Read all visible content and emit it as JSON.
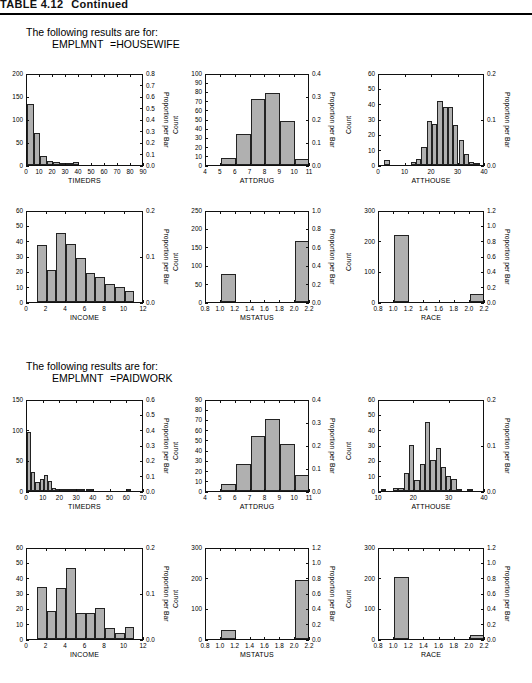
{
  "table_header": {
    "number": "TABLE 4.12",
    "text": "Continued"
  },
  "sections": [
    {
      "id": "housewife",
      "caption_line1": "The following results are for:",
      "caption_var": "EMPLMNT",
      "caption_value": "=HOUSEWIFE"
    },
    {
      "id": "paidwork",
      "caption_line1": "The following results are for:",
      "caption_var": "EMPLMNT",
      "caption_value": "=PAIDWORK"
    }
  ],
  "axis_titles": {
    "count": "Count",
    "proportion": "Proportion per Bar"
  },
  "chart_data": [
    {
      "id": "hw-timedrs",
      "type": "bar",
      "group": "HOUSEWIFE",
      "title": "",
      "xlabel": "TIMEDRS",
      "ylabel": "Count",
      "y2label": "Proportion per Bar",
      "xlim": [
        0,
        90
      ],
      "ylim": [
        0,
        200
      ],
      "y2lim": [
        0.0,
        0.8
      ],
      "grid": false,
      "xticks": [
        0,
        10,
        20,
        30,
        40,
        50,
        60,
        70,
        80,
        90
      ],
      "yticks": [
        0,
        50,
        100,
        150,
        200
      ],
      "y2ticks": [
        "0.0",
        "0.1",
        "0.2",
        "0.3",
        "0.4",
        "0.5",
        "0.6",
        "0.7",
        "0.8"
      ],
      "bin_width": 5,
      "bins": [
        0,
        5,
        10,
        15,
        20,
        25,
        30,
        35,
        40
      ],
      "values": [
        132,
        69,
        20,
        9,
        7,
        5,
        5,
        6
      ]
    },
    {
      "id": "hw-attdrug",
      "type": "bar",
      "group": "HOUSEWIFE",
      "title": "",
      "xlabel": "ATTDRUG",
      "ylabel": "Count",
      "y2label": "Proportion per Bar",
      "xlim": [
        4,
        11
      ],
      "ylim": [
        0,
        100
      ],
      "y2lim": [
        0.0,
        0.4
      ],
      "grid": false,
      "xticks": [
        4,
        5,
        6,
        7,
        8,
        9,
        10,
        11
      ],
      "yticks": [
        0,
        10,
        20,
        30,
        40,
        50,
        60,
        70,
        80,
        90,
        100
      ],
      "y2ticks": [
        "0.0",
        "0.1",
        "0.2",
        "0.3",
        "0.4"
      ],
      "bin_width": 1,
      "bins": [
        5,
        6,
        7,
        8,
        9,
        10
      ],
      "values": [
        8,
        34,
        72,
        78,
        48,
        6
      ]
    },
    {
      "id": "hw-atthouse",
      "type": "bar",
      "group": "HOUSEWIFE",
      "title": "",
      "xlabel": "ATTHOUSE",
      "ylabel": "Count",
      "y2label": "Proportion per Bar",
      "xlim": [
        0,
        40
      ],
      "ylim": [
        0,
        60
      ],
      "y2lim": [
        0.0,
        0.2
      ],
      "grid": false,
      "xticks": [
        0,
        10,
        20,
        30,
        40
      ],
      "yticks": [
        0,
        10,
        20,
        30,
        40,
        50,
        60
      ],
      "y2ticks": [
        "0.0",
        "0.1",
        "0.2"
      ],
      "bin_width": 2,
      "bins": [
        2,
        12,
        14,
        16,
        18,
        20,
        22,
        24,
        26,
        28,
        30,
        32,
        34,
        36
      ],
      "values": [
        3,
        2,
        4,
        12,
        29,
        27,
        42,
        38,
        38,
        26,
        16,
        7,
        2,
        1
      ]
    },
    {
      "id": "hw-income",
      "type": "bar",
      "group": "HOUSEWIFE",
      "title": "",
      "xlabel": "INCOME",
      "ylabel": "Count",
      "y2label": "Proportion per Bar",
      "xlim": [
        0,
        12
      ],
      "ylim": [
        0,
        60
      ],
      "y2lim": [
        0.0,
        0.2
      ],
      "grid": false,
      "xticks": [
        0,
        2,
        4,
        6,
        8,
        10,
        12
      ],
      "yticks": [
        0,
        10,
        20,
        30,
        40,
        50,
        60
      ],
      "y2ticks": [
        "0.0",
        "0.1",
        "0.2"
      ],
      "bin_width": 1,
      "bins": [
        1,
        2,
        3,
        4,
        5,
        6,
        7,
        8,
        9,
        10
      ],
      "values": [
        37,
        21,
        45,
        38,
        29,
        19,
        16,
        12,
        10,
        7
      ]
    },
    {
      "id": "hw-mstatus",
      "type": "bar",
      "group": "HOUSEWIFE",
      "title": "",
      "xlabel": "MSTATUS",
      "ylabel": "Count",
      "y2label": "Proportion per Bar",
      "xlim": [
        0.8,
        2.2
      ],
      "ylim": [
        0,
        250
      ],
      "y2lim": [
        0.0,
        1.0
      ],
      "grid": false,
      "xticks": [
        "0.8",
        "1.0",
        "1.2",
        "1.4",
        "1.6",
        "1.8",
        "2.0",
        "2.2"
      ],
      "yticks": [
        0,
        50,
        100,
        150,
        200,
        250
      ],
      "y2ticks": [
        "0.0",
        "0.2",
        "0.4",
        "0.6",
        "0.8",
        "1.0"
      ],
      "bin_width": 0.2,
      "bins": [
        1.0,
        2.0
      ],
      "values": [
        76,
        166
      ]
    },
    {
      "id": "hw-race",
      "type": "bar",
      "group": "HOUSEWIFE",
      "title": "",
      "xlabel": "RACE",
      "ylabel": "Count",
      "y2label": "Proportion per Bar",
      "xlim": [
        0.8,
        2.2
      ],
      "ylim": [
        0,
        300
      ],
      "y2lim": [
        0.0,
        1.2
      ],
      "grid": false,
      "xticks": [
        "0.8",
        "1.0",
        "1.2",
        "1.4",
        "1.6",
        "1.8",
        "2.0",
        "2.2"
      ],
      "yticks": [
        0,
        100,
        200,
        300
      ],
      "y2ticks": [
        "0.0",
        "0.2",
        "0.4",
        "0.6",
        "0.8",
        "1.0",
        "1.2"
      ],
      "bin_width": 0.2,
      "bins": [
        1.0,
        2.0
      ],
      "values": [
        218,
        27
      ]
    },
    {
      "id": "pw-timedrs",
      "type": "bar",
      "group": "PAIDWORK",
      "title": "",
      "xlabel": "TIMEDRS",
      "ylabel": "Count",
      "y2label": "Proportion per Bar",
      "xlim": [
        0,
        70
      ],
      "ylim": [
        0,
        150
      ],
      "y2lim": [
        0.0,
        0.6
      ],
      "grid": false,
      "xticks": [
        0,
        10,
        20,
        30,
        40,
        50,
        60,
        70
      ],
      "yticks": [
        0,
        50,
        100,
        150
      ],
      "y2ticks": [
        "0.0",
        "0.1",
        "0.2",
        "0.3",
        "0.4",
        "0.5",
        "0.6"
      ],
      "bin_width": 2.5,
      "bins": [
        0,
        2.5,
        5,
        7.5,
        10,
        12.5,
        15,
        17.5,
        20,
        22.5,
        25,
        27.5,
        30,
        32.5,
        35,
        37.5,
        40,
        60
      ],
      "values": [
        96,
        31,
        15,
        19,
        26,
        17,
        5,
        4,
        2,
        2,
        3,
        3,
        2,
        2,
        1,
        1,
        0,
        1
      ]
    },
    {
      "id": "pw-attdrug",
      "type": "bar",
      "group": "PAIDWORK",
      "title": "",
      "xlabel": "ATTDRUG",
      "ylabel": "Count",
      "y2label": "Proportion per Bar",
      "xlim": [
        4,
        11
      ],
      "ylim": [
        0,
        90
      ],
      "y2lim": [
        0.0,
        0.4
      ],
      "grid": false,
      "xticks": [
        4,
        5,
        6,
        7,
        8,
        9,
        10,
        11
      ],
      "yticks": [
        0,
        10,
        20,
        30,
        40,
        50,
        60,
        70,
        80,
        90
      ],
      "y2ticks": [
        "0.0",
        "0.1",
        "0.2",
        "0.3",
        "0.4"
      ],
      "bin_width": 1,
      "bins": [
        5,
        6,
        7,
        8,
        9,
        10
      ],
      "values": [
        7,
        26,
        54,
        70,
        46,
        16
      ]
    },
    {
      "id": "pw-atthouse",
      "type": "bar",
      "group": "PAIDWORK",
      "title": "",
      "xlabel": "ATTHOUSE",
      "ylabel": "Count",
      "y2label": "Proportion per Bar",
      "xlim": [
        10,
        40
      ],
      "ylim": [
        0,
        60
      ],
      "y2lim": [
        0.0,
        0.2
      ],
      "grid": false,
      "xticks": [
        10,
        20,
        30,
        40
      ],
      "yticks": [
        0,
        10,
        20,
        30,
        40,
        50,
        60
      ],
      "y2ticks": [
        "0.0",
        "0.1",
        "0.2"
      ],
      "bin_width": 1.5,
      "bins": [
        10.5,
        14,
        15.5,
        17,
        18.5,
        20,
        21.5,
        23,
        24.5,
        26,
        27.5,
        29,
        30.5,
        32,
        35
      ],
      "values": [
        1,
        2,
        2,
        12,
        30,
        7.5,
        17.5,
        45,
        20.5,
        28,
        15.5,
        9.5,
        8,
        1,
        1.5
      ]
    },
    {
      "id": "pw-income",
      "type": "bar",
      "group": "PAIDWORK",
      "title": "",
      "xlabel": "INCOME",
      "ylabel": "Count",
      "y2label": "Proportion per Bar",
      "xlim": [
        0,
        12
      ],
      "ylim": [
        0,
        60
      ],
      "y2lim": [
        0.0,
        0.2
      ],
      "grid": false,
      "xticks": [
        0,
        2,
        4,
        6,
        8,
        10,
        12
      ],
      "yticks": [
        0,
        10,
        20,
        30,
        40,
        50,
        60
      ],
      "y2ticks": [
        "0.0",
        "0.1",
        "0.2"
      ],
      "bin_width": 1,
      "bins": [
        1,
        2,
        3,
        4,
        5,
        6,
        7,
        8,
        9,
        10
      ],
      "values": [
        34,
        18,
        33,
        46,
        17,
        17,
        20,
        7,
        4,
        8
      ]
    },
    {
      "id": "pw-mstatus",
      "type": "bar",
      "group": "PAIDWORK",
      "title": "",
      "xlabel": "MSTATUS",
      "ylabel": "Count",
      "y2label": "Proportion per Bar",
      "xlim": [
        0.8,
        2.2
      ],
      "ylim": [
        0,
        300
      ],
      "y2lim": [
        0.0,
        1.2
      ],
      "grid": false,
      "xticks": [
        "0.8",
        "1.0",
        "1.2",
        "1.4",
        "1.6",
        "1.8",
        "2.0",
        "2.2"
      ],
      "yticks": [
        0,
        100,
        200,
        300
      ],
      "y2ticks": [
        "0.0",
        "0.2",
        "0.4",
        "0.6",
        "0.8",
        "1.0",
        "1.2"
      ],
      "bin_width": 0.2,
      "bins": [
        1.0,
        2.0
      ],
      "values": [
        28,
        193
      ]
    },
    {
      "id": "pw-race",
      "type": "bar",
      "group": "PAIDWORK",
      "title": "",
      "xlabel": "RACE",
      "ylabel": "Count",
      "y2label": "Proportion per Bar",
      "xlim": [
        0.8,
        2.2
      ],
      "ylim": [
        0,
        300
      ],
      "y2lim": [
        0.0,
        1.2
      ],
      "grid": false,
      "xticks": [
        "0.8",
        "1.0",
        "1.2",
        "1.4",
        "1.6",
        "1.8",
        "2.0",
        "2.2"
      ],
      "yticks": [
        0,
        100,
        200,
        300
      ],
      "y2ticks": [
        "0.0",
        "0.2",
        "0.4",
        "0.6",
        "0.8",
        "1.0",
        "1.2"
      ],
      "bin_width": 0.2,
      "bins": [
        1.0,
        2.0
      ],
      "values": [
        202,
        14
      ]
    }
  ],
  "layout": {
    "panels": [
      {
        "id": "hw-timedrs",
        "left": 26,
        "top": 74,
        "w": 117,
        "h": 92
      },
      {
        "id": "hw-attdrug",
        "left": 205,
        "top": 74,
        "w": 104,
        "h": 92
      },
      {
        "id": "hw-atthouse",
        "left": 378,
        "top": 74,
        "w": 106,
        "h": 92
      },
      {
        "id": "hw-income",
        "left": 26,
        "top": 211,
        "w": 117,
        "h": 92
      },
      {
        "id": "hw-mstatus",
        "left": 205,
        "top": 211,
        "w": 104,
        "h": 92
      },
      {
        "id": "hw-race",
        "left": 378,
        "top": 211,
        "w": 106,
        "h": 92
      },
      {
        "id": "pw-timedrs",
        "left": 26,
        "top": 400,
        "w": 117,
        "h": 92
      },
      {
        "id": "pw-attdrug",
        "left": 205,
        "top": 400,
        "w": 104,
        "h": 92
      },
      {
        "id": "pw-atthouse",
        "left": 378,
        "top": 400,
        "w": 106,
        "h": 92
      },
      {
        "id": "pw-income",
        "left": 26,
        "top": 548,
        "w": 117,
        "h": 92
      },
      {
        "id": "pw-mstatus",
        "left": 205,
        "top": 548,
        "w": 104,
        "h": 92
      },
      {
        "id": "pw-race",
        "left": 378,
        "top": 548,
        "w": 106,
        "h": 92
      }
    ],
    "captions": [
      {
        "id": "housewife",
        "left": 26,
        "top": 26
      },
      {
        "id": "paidwork",
        "left": 26,
        "top": 360
      }
    ]
  }
}
